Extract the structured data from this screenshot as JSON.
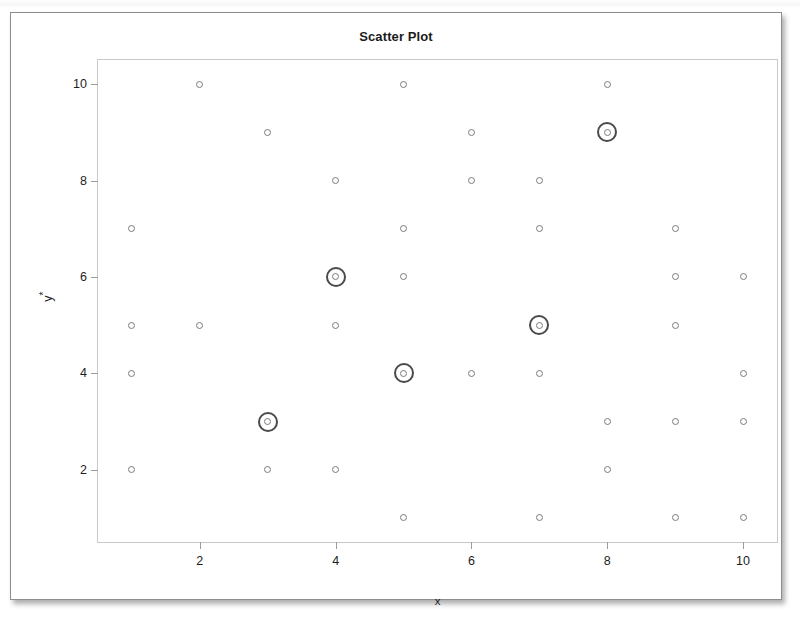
{
  "chart_data": {
    "type": "scatter",
    "title": "Scatter Plot",
    "xlabel": "x",
    "ylabel": "y*",
    "xlim": [
      0.5,
      10.5
    ],
    "ylim": [
      0.5,
      10.5
    ],
    "grid": false,
    "legend": null,
    "xticks": [
      2,
      4,
      6,
      8,
      10
    ],
    "yticks": [
      2,
      4,
      6,
      8,
      10
    ],
    "marker": "open-circle",
    "highlight_marker": "circled-open-circle",
    "marker_color": "#7b7b7b",
    "highlight_ring_color": "#4a4a4a",
    "points": [
      {
        "x": 2,
        "y": 10,
        "highlight": false
      },
      {
        "x": 5,
        "y": 10,
        "highlight": false
      },
      {
        "x": 8,
        "y": 10,
        "highlight": false
      },
      {
        "x": 3,
        "y": 9,
        "highlight": false
      },
      {
        "x": 6,
        "y": 9,
        "highlight": false
      },
      {
        "x": 8,
        "y": 9,
        "highlight": true
      },
      {
        "x": 4,
        "y": 8,
        "highlight": false
      },
      {
        "x": 6,
        "y": 8,
        "highlight": false
      },
      {
        "x": 7,
        "y": 8,
        "highlight": false
      },
      {
        "x": 1,
        "y": 7,
        "highlight": false
      },
      {
        "x": 5,
        "y": 7,
        "highlight": false
      },
      {
        "x": 7,
        "y": 7,
        "highlight": false
      },
      {
        "x": 9,
        "y": 7,
        "highlight": false
      },
      {
        "x": 4,
        "y": 6,
        "highlight": true
      },
      {
        "x": 5,
        "y": 6,
        "highlight": false
      },
      {
        "x": 9,
        "y": 6,
        "highlight": false
      },
      {
        "x": 10,
        "y": 6,
        "highlight": false
      },
      {
        "x": 1,
        "y": 5,
        "highlight": false
      },
      {
        "x": 2,
        "y": 5,
        "highlight": false
      },
      {
        "x": 4,
        "y": 5,
        "highlight": false
      },
      {
        "x": 7,
        "y": 5,
        "highlight": true
      },
      {
        "x": 9,
        "y": 5,
        "highlight": false
      },
      {
        "x": 1,
        "y": 4,
        "highlight": false
      },
      {
        "x": 5,
        "y": 4,
        "highlight": true
      },
      {
        "x": 6,
        "y": 4,
        "highlight": false
      },
      {
        "x": 7,
        "y": 4,
        "highlight": false
      },
      {
        "x": 10,
        "y": 4,
        "highlight": false
      },
      {
        "x": 3,
        "y": 3,
        "highlight": true
      },
      {
        "x": 8,
        "y": 3,
        "highlight": false
      },
      {
        "x": 9,
        "y": 3,
        "highlight": false
      },
      {
        "x": 10,
        "y": 3,
        "highlight": false
      },
      {
        "x": 1,
        "y": 2,
        "highlight": false
      },
      {
        "x": 3,
        "y": 2,
        "highlight": false
      },
      {
        "x": 4,
        "y": 2,
        "highlight": false
      },
      {
        "x": 8,
        "y": 2,
        "highlight": false
      },
      {
        "x": 5,
        "y": 1,
        "highlight": false
      },
      {
        "x": 7,
        "y": 1,
        "highlight": false
      },
      {
        "x": 9,
        "y": 1,
        "highlight": false
      },
      {
        "x": 10,
        "y": 1,
        "highlight": false
      }
    ]
  },
  "figure": {
    "title": "Scatter Plot",
    "xlabel": "x",
    "ylabel_base": "y",
    "ylabel_sup": "*"
  }
}
